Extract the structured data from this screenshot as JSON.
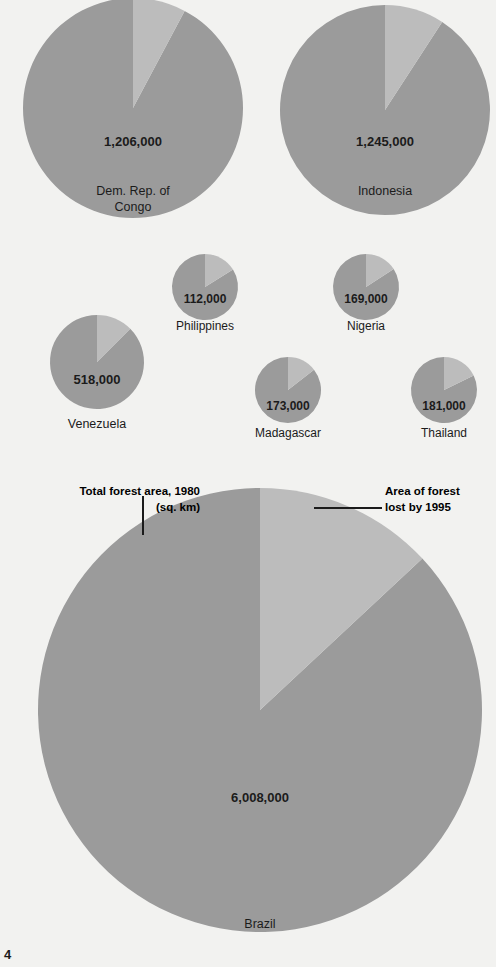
{
  "page": {
    "page_number": "4",
    "background_color": "#f2f2f0"
  },
  "legend": {
    "left": {
      "line1": "Total forest area, 1980",
      "line2": "(sq. km)",
      "swatch_color": "#9b9b9b"
    },
    "right": {
      "line1": "Area of forest",
      "line2": "lost by 1995",
      "swatch_color": "#bcbcbc"
    }
  },
  "colors": {
    "remaining_forest": "#9b9b9b",
    "forest_lost": "#bcbcbc",
    "text": "#1b1b1b",
    "background": "#f2f2f0"
  },
  "chart_data": {
    "type": "pie",
    "units": "sq. km",
    "legend_entries": [
      "Total forest area, 1980 (sq. km)",
      "Area of forest lost by 1995"
    ],
    "legend_position": "top-of-brazil-chart",
    "series": [
      {
        "name": "Total forest area, 1980",
        "color": "#9b9b9b"
      },
      {
        "name": "Area of forest lost by 1995",
        "color": "#bcbcbc"
      }
    ],
    "charts": [
      {
        "country": "Dem. Rep. of Congo",
        "label_lines": [
          "Dem. Rep. of",
          "Congo"
        ],
        "total_forest_1980": 1206000,
        "value_label": "1,206,000",
        "lost_fraction": 0.078,
        "lost_angle_deg": 28,
        "cx": 133,
        "cy": 108,
        "r": 110,
        "value_x": 133,
        "value_y": 146,
        "label_x": 133,
        "label_y": 195,
        "value_font_size": 13,
        "label_font_size": 12.5
      },
      {
        "country": "Indonesia",
        "label_lines": [
          "Indonesia"
        ],
        "total_forest_1980": 1245000,
        "value_label": "1,245,000",
        "lost_fraction": 0.092,
        "lost_angle_deg": 33,
        "cx": 385,
        "cy": 110,
        "r": 105,
        "value_x": 385,
        "value_y": 146,
        "label_x": 385,
        "label_y": 195,
        "value_font_size": 13,
        "label_font_size": 12.5
      },
      {
        "country": "Philippines",
        "label_lines": [
          "Philippines"
        ],
        "total_forest_1980": 112000,
        "value_label": "112,000",
        "lost_fraction": 0.161,
        "lost_angle_deg": 58,
        "cx": 205,
        "cy": 287,
        "r": 33,
        "value_x": 205,
        "value_y": 303,
        "label_x": 205,
        "label_y": 330,
        "value_font_size": 12,
        "label_font_size": 12
      },
      {
        "country": "Nigeria",
        "label_lines": [
          "Nigeria"
        ],
        "total_forest_1980": 169000,
        "value_label": "169,000",
        "lost_fraction": 0.158,
        "lost_angle_deg": 57,
        "cx": 366,
        "cy": 287,
        "r": 33,
        "value_x": 366,
        "value_y": 303,
        "label_x": 366,
        "label_y": 330,
        "value_font_size": 12,
        "label_font_size": 12
      },
      {
        "country": "Venezuela",
        "label_lines": [
          "Venezuela"
        ],
        "total_forest_1980": 518000,
        "value_label": "518,000",
        "lost_fraction": 0.125,
        "lost_angle_deg": 45,
        "cx": 97,
        "cy": 362,
        "r": 47,
        "value_x": 97,
        "value_y": 384,
        "label_x": 97,
        "label_y": 428,
        "value_font_size": 13,
        "label_font_size": 12.5
      },
      {
        "country": "Madagascar",
        "label_lines": [
          "Madagascar"
        ],
        "total_forest_1980": 173000,
        "value_label": "173,000",
        "lost_fraction": 0.144,
        "lost_angle_deg": 52,
        "cx": 288,
        "cy": 390,
        "r": 33,
        "value_x": 288,
        "value_y": 410,
        "label_x": 288,
        "label_y": 437,
        "value_font_size": 12,
        "label_font_size": 12
      },
      {
        "country": "Thailand",
        "label_lines": [
          "Thailand"
        ],
        "total_forest_1980": 181000,
        "value_label": "181,000",
        "lost_fraction": 0.178,
        "lost_angle_deg": 64,
        "cx": 444,
        "cy": 390,
        "r": 33,
        "value_x": 444,
        "value_y": 410,
        "label_x": 444,
        "label_y": 437,
        "value_font_size": 12,
        "label_font_size": 12
      },
      {
        "country": "Brazil",
        "label_lines": [
          "Brazil"
        ],
        "total_forest_1980": 6008000,
        "value_label": "6,008,000",
        "lost_fraction": 0.131,
        "lost_angle_deg": 47,
        "cx": 260,
        "cy": 710,
        "r": 222,
        "value_x": 260,
        "value_y": 802,
        "label_x": 260,
        "label_y": 928,
        "value_font_size": 13,
        "label_font_size": 12.5
      }
    ]
  }
}
